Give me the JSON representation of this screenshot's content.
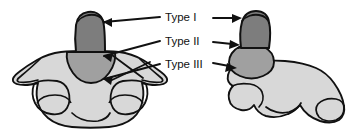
{
  "figure": {
    "background_color": "#ffffff",
    "outline_color": "#111111",
    "palette": {
      "tone_dark": "#7d7d7d",
      "tone_mid": "#a0a0a0",
      "tone_light": "#d8d8d8",
      "stroke": "#111111",
      "text": "#111111"
    }
  },
  "labels": [
    {
      "id": "type-1",
      "text": "Type I",
      "x": 165,
      "y": 18
    },
    {
      "id": "type-2",
      "text": "Type II",
      "x": 165,
      "y": 42
    },
    {
      "id": "type-3",
      "text": "Type III",
      "x": 165,
      "y": 65
    }
  ],
  "views": {
    "anterior": {
      "name": "anterior-view",
      "caption": ""
    },
    "lateral": {
      "name": "lateral-view",
      "caption": ""
    }
  },
  "regions": {
    "dens_tip": {
      "name": "odontoid-tip-region",
      "tone": "#7d7d7d"
    },
    "dens_base": {
      "name": "odontoid-base-region",
      "tone": "#a0a0a0"
    },
    "body": {
      "name": "vertebral-body",
      "tone": "#d8d8d8"
    }
  },
  "arrows": {
    "count": 6,
    "color": "#111111"
  }
}
